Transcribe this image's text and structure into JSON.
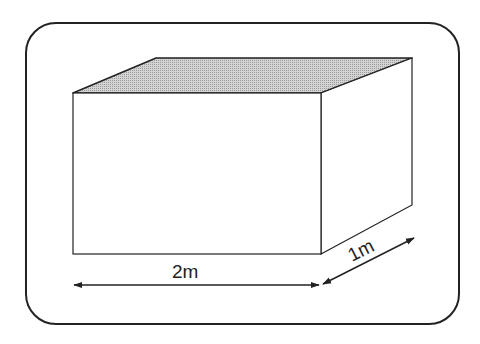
{
  "diagram": {
    "type": "rectangular-prism-dimensions",
    "colors": {
      "stroke": "#222222",
      "top_face": "#bcbcbc",
      "front_face": "#ffffff",
      "side_face": "#ffffff",
      "frame": "#222222"
    },
    "labels": {
      "length": "2m",
      "depth": "1m"
    }
  }
}
